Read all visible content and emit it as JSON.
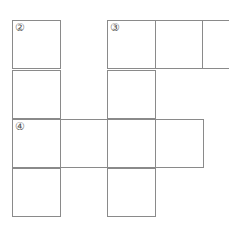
{
  "puzzle": {
    "type": "crossword-grid",
    "cell_size": 48,
    "line_color": "#8a8a8a",
    "cells": [
      {
        "row": 0,
        "col": 0,
        "number": "②",
        "open_right": false
      },
      {
        "row": 0,
        "col": 2,
        "number": "③",
        "open_right": false
      },
      {
        "row": 0,
        "col": 3,
        "number": "",
        "open_right": false
      },
      {
        "row": 0,
        "col": 4,
        "number": "",
        "open_right": true
      },
      {
        "row": 1,
        "col": 0,
        "number": "",
        "open_right": false
      },
      {
        "row": 1,
        "col": 2,
        "number": "",
        "open_right": false
      },
      {
        "row": 2,
        "col": 0,
        "number": "④",
        "open_right": false
      },
      {
        "row": 2,
        "col": 1,
        "number": "",
        "open_right": false
      },
      {
        "row": 2,
        "col": 2,
        "number": "",
        "open_right": false
      },
      {
        "row": 2,
        "col": 3,
        "number": "",
        "open_right": false
      },
      {
        "row": 3,
        "col": 0,
        "number": "",
        "open_right": false
      },
      {
        "row": 3,
        "col": 2,
        "number": "",
        "open_right": false
      }
    ]
  }
}
